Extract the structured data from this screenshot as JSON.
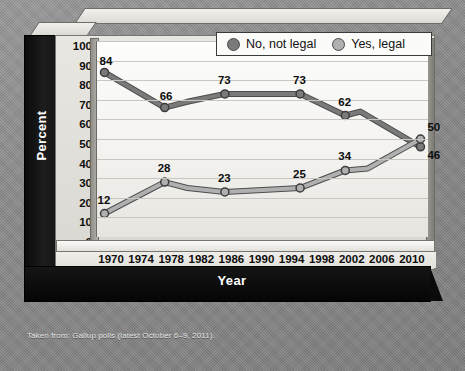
{
  "chart_data": {
    "type": "line",
    "title": "",
    "xlabel": "Year",
    "ylabel": "Percent",
    "x": [
      1970,
      1974,
      1978,
      1982,
      1986,
      1990,
      1994,
      1998,
      2002,
      2006,
      2010
    ],
    "tick_labels_x": [
      "1970",
      "1974",
      "1978",
      "1982",
      "1986",
      "1990",
      "1994",
      "1998",
      "2002",
      "2006",
      "2010"
    ],
    "tick_labels_y": [
      "100",
      "90",
      "80",
      "70",
      "60",
      "50",
      "40",
      "30",
      "20",
      "10",
      "0"
    ],
    "ylim": [
      0,
      100
    ],
    "xlim": [
      1968,
      2012
    ],
    "grid": true,
    "legend_position": "top-right",
    "series": [
      {
        "name": "No, not legal",
        "color": "#7a7a7a",
        "points": [
          {
            "x": 1969,
            "y": 84,
            "label": "84"
          },
          {
            "x": 1977,
            "y": 66,
            "label": "66"
          },
          {
            "x": 1985,
            "y": 73,
            "label": "73"
          },
          {
            "x": 1995,
            "y": 73,
            "label": "73"
          },
          {
            "x": 2001,
            "y": 62,
            "label": "62"
          },
          {
            "x": 2011,
            "y": 46,
            "label": "46"
          }
        ],
        "path": [
          {
            "x": 1969,
            "y": 84
          },
          {
            "x": 1977,
            "y": 66
          },
          {
            "x": 1980,
            "y": 69
          },
          {
            "x": 1985,
            "y": 73
          },
          {
            "x": 1995,
            "y": 73
          },
          {
            "x": 2001,
            "y": 62
          },
          {
            "x": 2003,
            "y": 64
          },
          {
            "x": 2011,
            "y": 46
          }
        ]
      },
      {
        "name": "Yes, legal",
        "color": "#b0b0b0",
        "points": [
          {
            "x": 1969,
            "y": 12,
            "label": "12"
          },
          {
            "x": 1977,
            "y": 28,
            "label": "28"
          },
          {
            "x": 1985,
            "y": 23,
            "label": "23"
          },
          {
            "x": 1995,
            "y": 25,
            "label": "25"
          },
          {
            "x": 2001,
            "y": 34,
            "label": "34"
          },
          {
            "x": 2011,
            "y": 50,
            "label": "50"
          }
        ],
        "path": [
          {
            "x": 1969,
            "y": 12
          },
          {
            "x": 1977,
            "y": 28
          },
          {
            "x": 1980,
            "y": 25
          },
          {
            "x": 1985,
            "y": 23
          },
          {
            "x": 1995,
            "y": 25
          },
          {
            "x": 2001,
            "y": 34
          },
          {
            "x": 2004,
            "y": 35
          },
          {
            "x": 2011,
            "y": 50
          }
        ]
      }
    ]
  },
  "legend": {
    "items": [
      {
        "label": "No, not legal",
        "color": "#7a7a7a"
      },
      {
        "label": "Yes, legal",
        "color": "#b0b0b0"
      }
    ]
  },
  "axes": {
    "y_title": "Percent",
    "x_title": "Year"
  },
  "caption": "Taken from: Gallup polls (latest October 6–9, 2011).",
  "colors": {
    "series_no": "#7a7a7a",
    "series_yes": "#b0b0b0",
    "background": "#8c8c8c",
    "panel": "#e9e7e2",
    "frame_dark": "#101010"
  }
}
